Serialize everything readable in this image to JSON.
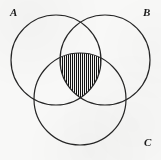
{
  "figure": {
    "type": "venn-diagram",
    "background_color": "#f8f8f7",
    "stroke_color": "#262626",
    "stroke_width": 1.2,
    "hatch_color": "#111111",
    "width": 161,
    "height": 160
  },
  "labels": {
    "a": "A",
    "b": "B",
    "c": "C"
  },
  "circles": [
    {
      "name": "A",
      "cx": 56,
      "cy": 60,
      "r": 45
    },
    {
      "name": "B",
      "cx": 105,
      "cy": 60,
      "r": 45
    },
    {
      "name": "C",
      "cx": 80,
      "cy": 99,
      "r": 46
    }
  ],
  "shaded_region": {
    "name": "A-intersect-B-intersect-C",
    "description": "triple intersection shaded with vertical hatch lines",
    "fill_pattern": "vertical-hatch",
    "hatch_spacing_px": 2,
    "path": "M 63.6 53.6 A 46 46 0 0 1 96.4 53.6 A 45 45 0 0 1 80 95.2 A 45 45 0 0 1 63.6 53.6 Z"
  }
}
